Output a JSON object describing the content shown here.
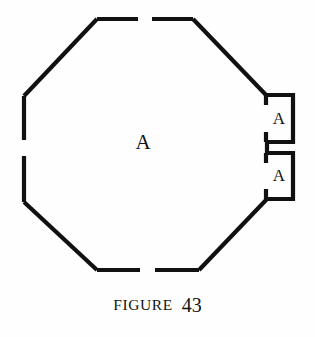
{
  "figure": {
    "caption_word": "FIGURE",
    "caption_number": "43",
    "background_color": "#fefefe",
    "line_color": "#111111",
    "center_label": "A",
    "alcoves": [
      {
        "label": "A",
        "position": "upper-right"
      },
      {
        "label": "A",
        "position": "lower-right"
      }
    ],
    "shape": {
      "type": "octagon",
      "openings": [
        "top-center",
        "bottom-center",
        "left-center"
      ],
      "vertices": [
        [
          24,
          96
        ],
        [
          97,
          19
        ],
        [
          193,
          19
        ],
        [
          267,
          96
        ],
        [
          267,
          199
        ],
        [
          199,
          270
        ],
        [
          97,
          270
        ],
        [
          24,
          202
        ]
      ]
    }
  }
}
